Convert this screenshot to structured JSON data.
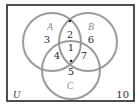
{
  "diagram": {
    "type": "venn-3-set",
    "universe_label": "U",
    "outside_count": "10",
    "sets": [
      {
        "label": "A",
        "cx": 52,
        "cy": 42,
        "r": 29,
        "label_x": 50,
        "label_y": 30
      },
      {
        "label": "B",
        "cx": 88,
        "cy": 42,
        "r": 29,
        "label_x": 90,
        "label_y": 30
      },
      {
        "label": "C",
        "cx": 71,
        "cy": 70,
        "r": 29,
        "label_x": 70,
        "label_y": 88
      }
    ],
    "regions": {
      "A_only": "3",
      "A_and_B_only": "2",
      "B_only": "6",
      "A_and_B_and_C": "1",
      "A_and_C_only": "4",
      "B_and_C_only": "7",
      "C_only": "5"
    },
    "colors": {
      "frame": "#222222",
      "circle": "#9a9a9a",
      "set_label": "#8a8a8a",
      "number": "#2a2a2a"
    }
  }
}
